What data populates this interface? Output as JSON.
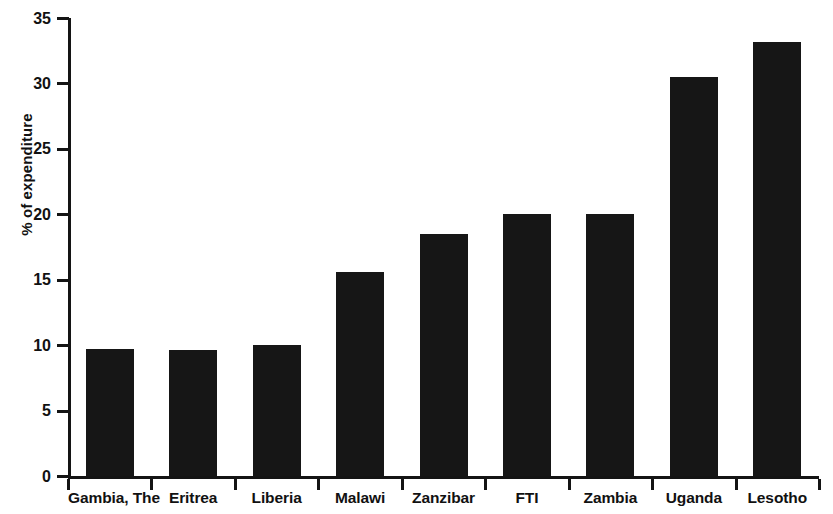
{
  "chart_data": {
    "type": "bar",
    "title": "",
    "subtitle": "",
    "xlabel": "",
    "ylabel": "% of expenditure",
    "categories": [
      "Gambia, The",
      "Eritrea",
      "Liberia",
      "Malawi",
      "Zanzibar",
      "FTI",
      "Zambia",
      "Uganda",
      "Lesotho"
    ],
    "values": [
      9.7,
      9.6,
      10.0,
      15.6,
      18.5,
      20.0,
      20.0,
      30.5,
      33.2
    ],
    "ylim": [
      0,
      35
    ],
    "ytick_step": 5,
    "yticks": [
      35,
      30,
      25,
      20,
      15,
      10,
      5,
      0
    ],
    "ytick_labels": [
      "35",
      "30",
      "25",
      "20",
      "15",
      "10",
      "5",
      "0"
    ],
    "grid": false,
    "legend": null,
    "bar_color": "#161616",
    "axis_color": "#141414",
    "background_color": "#ffffff",
    "annotations": []
  }
}
